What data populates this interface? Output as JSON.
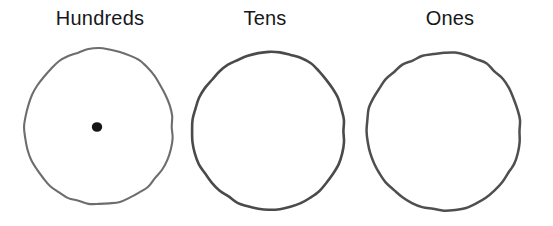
{
  "worksheet": {
    "background_color": "#ffffff",
    "ink_color": "#3b3b3e",
    "label_color": "#17171a",
    "columns": [
      {
        "label": "Hundreds",
        "label_center_x": 100,
        "circle": {
          "name": "hundreds-circle",
          "center_x": 99,
          "center_y": 127,
          "radius_x": 74,
          "radius_y": 78,
          "stroke_color": "#6d6d70",
          "stroke_width": 2.1
        },
        "dots": [
          {
            "name": "place-dot",
            "x": 97,
            "y": 127,
            "radius": 5.2,
            "fill": "#151517"
          }
        ],
        "dot_count": 1
      },
      {
        "label": "Tens",
        "label_center_x": 265,
        "circle": {
          "name": "tens-circle",
          "center_x": 269,
          "center_y": 131,
          "radius_x": 76,
          "radius_y": 79,
          "stroke_color": "#4a4a4d",
          "stroke_width": 2.6
        },
        "dots": [],
        "dot_count": 0
      },
      {
        "label": "Ones",
        "label_center_x": 450,
        "circle": {
          "name": "ones-circle",
          "center_x": 444,
          "center_y": 131,
          "radius_x": 77,
          "radius_y": 79,
          "stroke_color": "#4f4f52",
          "stroke_width": 2.5
        },
        "dots": [],
        "dot_count": 0
      }
    ]
  }
}
